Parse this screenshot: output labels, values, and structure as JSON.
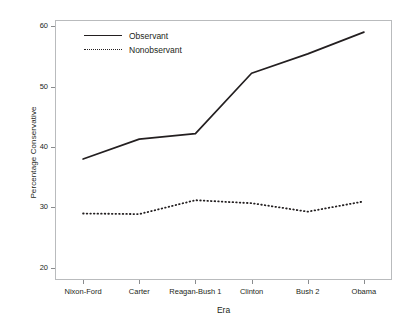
{
  "chart_data": {
    "type": "line",
    "title": "",
    "subtitle": "",
    "xlabel": "Era",
    "ylabel": "Percentage Conservative",
    "categories": [
      "Nixon-Ford",
      "Carter",
      "Reagan-Bush 1",
      "Clinton",
      "Bush 2",
      "Obama"
    ],
    "series": [
      {
        "name": "Observant",
        "style": "solid",
        "color": "#231f20",
        "values": [
          38.0,
          41.3,
          42.2,
          52.2,
          55.4,
          59.0
        ]
      },
      {
        "name": "Nonobservant",
        "style": "dotted",
        "color": "#231f20",
        "values": [
          29.0,
          28.9,
          31.2,
          30.7,
          29.3,
          31.0
        ]
      }
    ],
    "ylim": [
      18,
      61
    ],
    "yticks": [
      20,
      30,
      40,
      50,
      60
    ],
    "ytick_labels": [
      "20",
      "30",
      "40",
      "50",
      "60"
    ],
    "xtick_labels": [
      "Nixon-Ford",
      "Carter",
      "Reagan-Bush 1",
      "Clinton",
      "Bush 2",
      "Obama"
    ],
    "grid": false,
    "legend_position": "top-left-inside",
    "legend_entries": [
      "Observant",
      "Nonobservant"
    ]
  },
  "axes": {
    "y_title": "Percentage Conservative",
    "x_title": "Era"
  },
  "colors": {
    "line": "#231f20",
    "frame": "#b9bbbd",
    "tick": "#8a8c8e",
    "background": "#ffffff"
  }
}
